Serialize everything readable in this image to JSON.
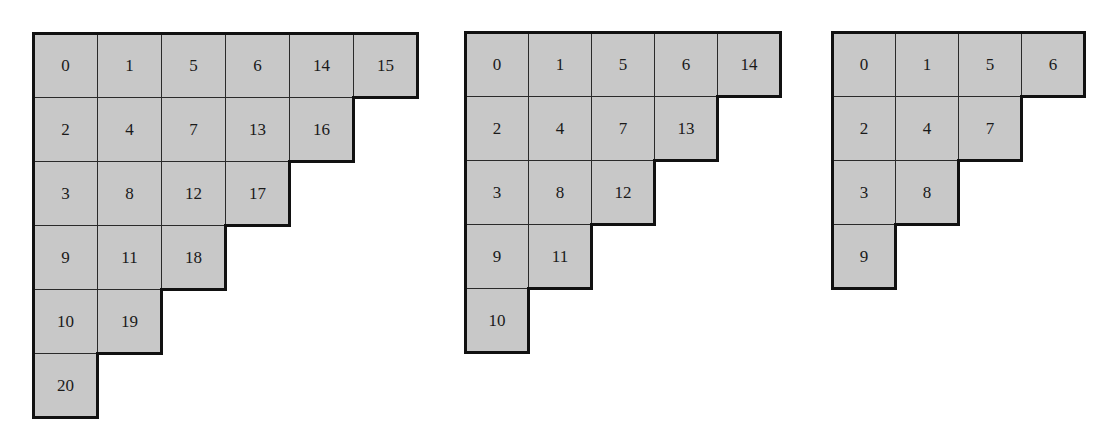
{
  "diagrams": [
    {
      "name": "staircase-6",
      "left": 33,
      "top": 33,
      "cell_w": 64,
      "cell_h": 64,
      "rows": [
        [
          "0",
          "1",
          "5",
          "6",
          "14",
          "15"
        ],
        [
          "2",
          "4",
          "7",
          "13",
          "16"
        ],
        [
          "3",
          "8",
          "12",
          "17"
        ],
        [
          "9",
          "11",
          "18"
        ],
        [
          "10",
          "19"
        ],
        [
          "20"
        ]
      ]
    },
    {
      "name": "staircase-5",
      "left": 465,
      "top": 32,
      "cell_w": 63,
      "cell_h": 64,
      "rows": [
        [
          "0",
          "1",
          "5",
          "6",
          "14"
        ],
        [
          "2",
          "4",
          "7",
          "13"
        ],
        [
          "3",
          "8",
          "12"
        ],
        [
          "9",
          "11"
        ],
        [
          "10"
        ]
      ]
    },
    {
      "name": "staircase-4",
      "left": 832,
      "top": 32,
      "cell_w": 63,
      "cell_h": 64,
      "rows": [
        [
          "0",
          "1",
          "5",
          "6"
        ],
        [
          "2",
          "4",
          "7"
        ],
        [
          "3",
          "8"
        ],
        [
          "9"
        ]
      ]
    }
  ],
  "colors": {
    "cell_fill": "#c8c8c8",
    "border": "#111111",
    "text": "#1a1a1a"
  }
}
